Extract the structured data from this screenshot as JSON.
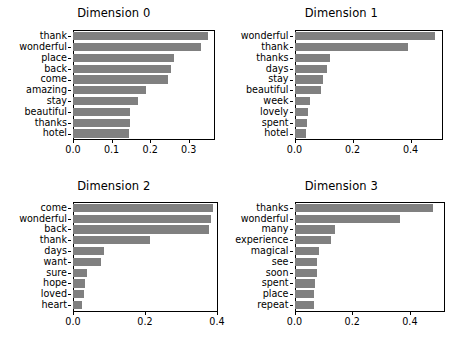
{
  "figure": {
    "background": "#ffffff",
    "bar_color": "#808080",
    "axis_color": "#000000",
    "text_color": "#000000"
  },
  "chart_data": [
    {
      "type": "bar",
      "orientation": "horizontal",
      "title": "Dimension 0",
      "xlabel": "",
      "ylabel": "",
      "xlim": [
        0.0,
        0.368
      ],
      "grid": false,
      "legend": null,
      "xticks": [
        0.0,
        0.1,
        0.2,
        0.3
      ],
      "xticklabels": [
        "0.0",
        "0.1",
        "0.2",
        "0.3"
      ],
      "categories": [
        "thank",
        "wonderful",
        "place",
        "back",
        "come",
        "amazing",
        "stay",
        "beautiful",
        "thanks",
        "hotel"
      ],
      "values": [
        0.35,
        0.332,
        0.262,
        0.254,
        0.245,
        0.19,
        0.169,
        0.148,
        0.147,
        0.145
      ]
    },
    {
      "type": "bar",
      "orientation": "horizontal",
      "title": "Dimension 1",
      "xlabel": "",
      "ylabel": "",
      "xlim": [
        0.0,
        0.51
      ],
      "grid": false,
      "legend": null,
      "xticks": [
        0.0,
        0.2,
        0.4
      ],
      "xticklabels": [
        "0.0",
        "0.2",
        "0.4"
      ],
      "categories": [
        "wonderful",
        "thank",
        "thanks",
        "days",
        "stay",
        "beautiful",
        "week",
        "lovely",
        "spent",
        "hotel"
      ],
      "values": [
        0.485,
        0.392,
        0.123,
        0.112,
        0.098,
        0.092,
        0.054,
        0.047,
        0.042,
        0.04
      ]
    },
    {
      "type": "bar",
      "orientation": "horizontal",
      "title": "Dimension 2",
      "xlabel": "",
      "ylabel": "",
      "xlim": [
        0.0,
        0.403
      ],
      "grid": false,
      "legend": null,
      "xticks": [
        0.0,
        0.2,
        0.4
      ],
      "xticklabels": [
        "0.0",
        "0.2",
        "0.4"
      ],
      "categories": [
        "come",
        "wonderful",
        "back",
        "thank",
        "days",
        "want",
        "sure",
        "hope",
        "loved",
        "heart"
      ],
      "values": [
        0.389,
        0.384,
        0.377,
        0.214,
        0.086,
        0.079,
        0.04,
        0.032,
        0.031,
        0.026
      ]
    },
    {
      "type": "bar",
      "orientation": "horizontal",
      "title": "Dimension 3",
      "xlabel": "",
      "ylabel": "",
      "xlim": [
        0.0,
        0.52
      ],
      "grid": false,
      "legend": null,
      "xticks": [
        0.0,
        0.2,
        0.4
      ],
      "xticklabels": [
        "0.0",
        "0.2",
        "0.4"
      ],
      "categories": [
        "thanks",
        "wonderful",
        "many",
        "experience",
        "magical",
        "see",
        "soon",
        "spent",
        "place",
        "repeat"
      ],
      "values": [
        0.48,
        0.365,
        0.14,
        0.127,
        0.086,
        0.079,
        0.077,
        0.072,
        0.067,
        0.066
      ]
    }
  ]
}
